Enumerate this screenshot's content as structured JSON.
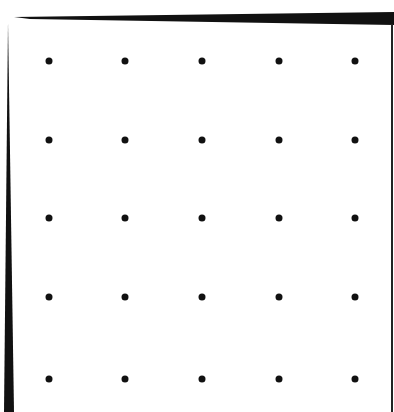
{
  "figure": {
    "dot_color": "#111111",
    "frame_color": "#111111",
    "grid": {
      "rows": 5,
      "cols": 5,
      "x": [
        49,
        125,
        202,
        279,
        355
      ],
      "y": [
        61,
        140,
        218,
        297,
        379
      ]
    }
  }
}
